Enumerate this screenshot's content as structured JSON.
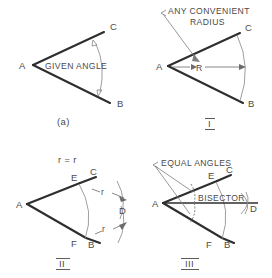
{
  "figure": {
    "panels": [
      {
        "id": "a",
        "caption": "(a)",
        "note": "GIVEN ANGLE",
        "points": [
          "A",
          "C",
          "B"
        ]
      },
      {
        "id": "I",
        "caption": "I",
        "note_line1": "ANY CONVENIENT",
        "note_line2": "RADIUS",
        "radius_label": "R",
        "points": [
          "A",
          "C",
          "B"
        ]
      },
      {
        "id": "II",
        "caption": "II",
        "note": "r = r",
        "radius_label_upper": "r",
        "radius_label_lower": "r",
        "points": [
          "A",
          "E",
          "C",
          "F",
          "B",
          "D"
        ]
      },
      {
        "id": "III",
        "caption": "III",
        "note": "EQUAL ANGLES",
        "bisector_label": "BISECTOR",
        "points": [
          "A",
          "E",
          "C",
          "F",
          "B",
          "D"
        ]
      }
    ],
    "labels": {
      "A": "A",
      "B": "B",
      "C": "C",
      "D": "D",
      "E": "E",
      "F": "F"
    },
    "colors": {
      "ink": "#2e2e2e",
      "construction": "#8d8d8d",
      "text": "#4a4a4a",
      "background": "#ffffff"
    }
  }
}
